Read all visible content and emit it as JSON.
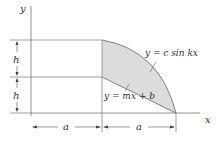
{
  "diagram": {
    "axes": {
      "x_label": "x",
      "y_label": "y"
    },
    "dimensions": {
      "h_upper": "h",
      "h_lower": "h",
      "a_left": "a",
      "a_right": "a"
    },
    "curves": {
      "upper": "y = c sin kx",
      "lower": "y = mx + b"
    },
    "colors": {
      "shade": "#d9d9d9",
      "line": "#555555"
    }
  }
}
